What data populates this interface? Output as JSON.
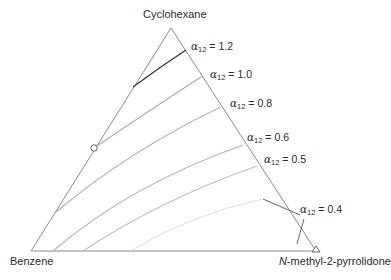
{
  "diagram": {
    "type": "ternary",
    "vertices": {
      "top": "Cyclohexane",
      "left": "Benzene",
      "right_prefix": "N",
      "right_suffix": "-methyl-2-pyrrolidone"
    },
    "curves": [
      {
        "label_symbol": "α",
        "label_sub": "12",
        "label_eq": " = 1.2",
        "color": "#333333"
      },
      {
        "label_symbol": "α",
        "label_sub": "12",
        "label_eq": " = 1.0",
        "color": "#aaaaaa"
      },
      {
        "label_symbol": "α",
        "label_sub": "12",
        "label_eq": " = 0.8",
        "color": "#b0b0b0"
      },
      {
        "label_symbol": "α",
        "label_sub": "12",
        "label_eq": " = 0.6",
        "color": "#b4b4b4"
      },
      {
        "label_symbol": "α",
        "label_sub": "12",
        "label_eq": " = 0.5",
        "color": "#bbbbbb"
      },
      {
        "label_symbol": "α",
        "label_sub": "12",
        "label_eq": " = 0.4",
        "color": "#d8d8d8"
      }
    ],
    "markers": [
      {
        "shape": "circle",
        "position": "left edge, on α12 = 1.0 curve"
      },
      {
        "shape": "triangle",
        "position": "N-methyl-2-pyrrolidone vertex"
      }
    ]
  }
}
